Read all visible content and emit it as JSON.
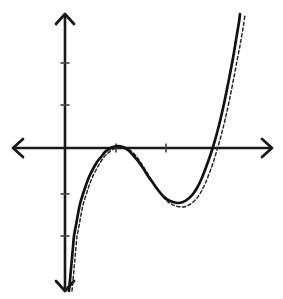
{
  "figure": {
    "background_color": "#ffffff",
    "width": 283,
    "height": 299
  },
  "chart_data": {
    "type": "line",
    "title": "",
    "subtitle": "",
    "xlabel": "",
    "ylabel": "",
    "grid": false,
    "legend_position": "none",
    "axis_style": "arrowed-cartesian",
    "origin_px": {
      "x": 65,
      "y": 148
    },
    "pixels_per_x_unit": 50,
    "pixels_per_y_unit": 42,
    "xlim": [
      -1.04,
      4.14
    ],
    "ylim": [
      -3.38,
      3.19
    ],
    "x_axis": {
      "line_start_px": 13,
      "line_end_px": 272,
      "y_px": 148,
      "tick_positions_px": [
        116,
        166
      ],
      "tick_values": [
        1,
        2
      ],
      "tick_labels": [
        "",
        ""
      ],
      "tick_length_px": 9,
      "left_arrow": true,
      "right_arrow": true
    },
    "y_axis": {
      "line_start_px": 14,
      "line_end_px": 291,
      "x_px": 65,
      "tick_positions_px": [
        63,
        105,
        194,
        236
      ],
      "tick_values": [
        2,
        1,
        -1,
        -2
      ],
      "tick_labels": [
        "",
        "",
        "",
        ""
      ],
      "tick_length_px": 9,
      "up_arrow": true,
      "down_arrow": true
    },
    "series": [
      {
        "name": "solid-curve",
        "style": "solid",
        "color": "#111111",
        "stroke_width": 2.7,
        "description": "cubic with a local maximum tangent to the x-axis and a local minimum below it",
        "features": {
          "local_max_px": {
            "x": 118,
            "y": 146
          },
          "local_min_px": {
            "x": 178,
            "y": 203
          },
          "x_intercept_right_px": 218,
          "enters_top_right_px": {
            "x": 240,
            "y": 14
          },
          "exits_bottom_left_px": {
            "x": 69,
            "y": 291
          }
        },
        "points_px": [
          [
            69,
            291
          ],
          [
            70,
            280
          ],
          [
            71,
            269
          ],
          [
            72,
            258
          ],
          [
            73,
            247
          ],
          [
            74,
            236
          ],
          [
            76,
            225
          ],
          [
            78,
            214
          ],
          [
            80,
            204
          ],
          [
            83,
            194
          ],
          [
            86,
            185
          ],
          [
            89,
            177
          ],
          [
            93,
            169
          ],
          [
            97,
            162
          ],
          [
            101,
            157
          ],
          [
            105,
            152
          ],
          [
            109,
            149
          ],
          [
            113,
            147
          ],
          [
            118,
            146
          ],
          [
            123,
            147
          ],
          [
            128,
            150
          ],
          [
            133,
            155
          ],
          [
            138,
            161
          ],
          [
            143,
            168
          ],
          [
            148,
            176
          ],
          [
            153,
            183
          ],
          [
            158,
            190
          ],
          [
            163,
            196
          ],
          [
            168,
            200
          ],
          [
            173,
            202
          ],
          [
            178,
            203
          ],
          [
            183,
            202
          ],
          [
            188,
            199
          ],
          [
            193,
            194
          ],
          [
            197,
            188
          ],
          [
            201,
            180
          ],
          [
            205,
            170
          ],
          [
            209,
            159
          ],
          [
            213,
            147
          ],
          [
            217,
            133
          ],
          [
            221,
            117
          ],
          [
            225,
            99
          ],
          [
            229,
            79
          ],
          [
            233,
            58
          ],
          [
            236,
            40
          ],
          [
            239,
            22
          ],
          [
            240,
            14
          ]
        ]
      },
      {
        "name": "dashed-curve",
        "style": "dashed",
        "color": "#2a2a2a",
        "stroke_width": 1.5,
        "dash_pattern": "3.2 2.6",
        "description": "near-identical cubic shifted slightly right and down relative to the solid curve",
        "features": {
          "local_max_px": {
            "x": 121,
            "y": 147
          },
          "local_min_px": {
            "x": 182,
            "y": 207
          },
          "x_intercept_right_px": 222,
          "enters_top_right_px": {
            "x": 245,
            "y": 14
          },
          "exits_bottom_left_px": {
            "x": 72,
            "y": 291
          }
        },
        "points_px": [
          [
            72,
            291
          ],
          [
            73,
            280
          ],
          [
            74,
            269
          ],
          [
            75,
            258
          ],
          [
            76,
            247
          ],
          [
            77,
            236
          ],
          [
            79,
            226
          ],
          [
            81,
            215
          ],
          [
            83,
            205
          ],
          [
            86,
            195
          ],
          [
            89,
            186
          ],
          [
            92,
            178
          ],
          [
            96,
            170
          ],
          [
            100,
            163
          ],
          [
            104,
            157
          ],
          [
            108,
            153
          ],
          [
            112,
            150
          ],
          [
            116,
            148
          ],
          [
            121,
            147
          ],
          [
            126,
            148
          ],
          [
            131,
            151
          ],
          [
            136,
            156
          ],
          [
            141,
            163
          ],
          [
            146,
            171
          ],
          [
            151,
            179
          ],
          [
            156,
            187
          ],
          [
            161,
            194
          ],
          [
            166,
            200
          ],
          [
            171,
            204
          ],
          [
            176,
            206
          ],
          [
            182,
            207
          ],
          [
            187,
            206
          ],
          [
            192,
            203
          ],
          [
            197,
            198
          ],
          [
            201,
            192
          ],
          [
            205,
            184
          ],
          [
            209,
            174
          ],
          [
            213,
            163
          ],
          [
            217,
            150
          ],
          [
            221,
            136
          ],
          [
            225,
            120
          ],
          [
            229,
            102
          ],
          [
            233,
            82
          ],
          [
            237,
            61
          ],
          [
            241,
            40
          ],
          [
            244,
            22
          ],
          [
            245,
            14
          ]
        ]
      }
    ]
  }
}
